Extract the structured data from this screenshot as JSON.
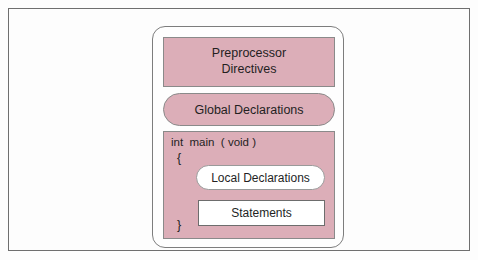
{
  "diagram": {
    "colors": {
      "section_fill": "#dcaeb8",
      "section_border": "#8a8a8a",
      "inner_fill": "#ffffff",
      "inner_border": "#6d6d6d",
      "container_border": "#7d7d7d",
      "page_border": "#6f6f6f",
      "text": "#241f1f",
      "background": "#fdfdfd"
    },
    "blocks": {
      "preprocessor": {
        "line1": "Preprocessor",
        "line2": "Directives",
        "shape": "rectangle"
      },
      "global_declarations": {
        "label": "Global Declarations",
        "shape": "pill"
      },
      "main_function": {
        "signature": "int  main  ( void )",
        "open_brace": "{",
        "close_brace": "}",
        "shape": "rectangle",
        "local_declarations": {
          "label": "Local Declarations",
          "shape": "pill"
        },
        "statements": {
          "label": "Statements",
          "shape": "rectangle"
        }
      }
    }
  }
}
